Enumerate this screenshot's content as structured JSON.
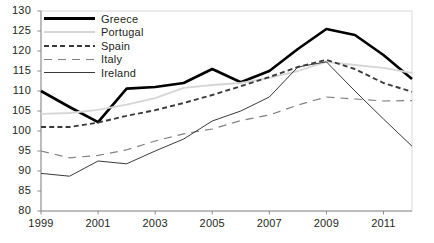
{
  "chart_data": {
    "type": "line",
    "title": "",
    "xlabel": "",
    "ylabel": "",
    "ylim": [
      80,
      130
    ],
    "xlim": [
      1999,
      2012
    ],
    "yticks": [
      80,
      85,
      90,
      95,
      100,
      105,
      110,
      115,
      120,
      125,
      130
    ],
    "xticks": [
      1999,
      2001,
      2003,
      2005,
      2007,
      2009,
      2011
    ],
    "x": [
      1999,
      2000,
      2001,
      2002,
      2003,
      2004,
      2005,
      2006,
      2007,
      2008,
      2009,
      2010,
      2011,
      2012
    ],
    "grid": false,
    "legend_position": "top-left",
    "series": [
      {
        "name": "Greece",
        "style": "solid-thick",
        "color": "#000000",
        "values": [
          110.0,
          106.0,
          102.2,
          110.6,
          111.0,
          112.0,
          115.5,
          112.2,
          115.0,
          120.5,
          125.5,
          124.0,
          119.0,
          113.0
        ]
      },
      {
        "name": "Portugal",
        "style": "solid-light",
        "color": "#d6d6d6",
        "values": [
          104.3,
          104.5,
          105.3,
          106.6,
          108.2,
          110.8,
          111.5,
          112.0,
          113.3,
          115.0,
          117.3,
          116.5,
          115.8,
          114.5
        ]
      },
      {
        "name": "Spain",
        "style": "dashed",
        "color": "#3a3a3a",
        "values": [
          101.0,
          101.0,
          102.1,
          103.8,
          105.2,
          107.0,
          109.0,
          111.2,
          113.5,
          116.0,
          117.8,
          115.5,
          112.0,
          109.8
        ]
      },
      {
        "name": "Italy",
        "style": "long-dash",
        "color": "#808080",
        "values": [
          95.0,
          93.3,
          93.9,
          95.3,
          97.5,
          99.3,
          100.5,
          102.6,
          104.0,
          106.5,
          108.5,
          108.0,
          107.5,
          107.6
        ]
      },
      {
        "name": "Ireland",
        "style": "solid-thin",
        "color": "#3a3a3a",
        "values": [
          89.4,
          88.7,
          92.5,
          91.8,
          95.0,
          98.0,
          102.5,
          105.0,
          108.5,
          116.0,
          117.3,
          110.0,
          103.0,
          96.2
        ]
      }
    ]
  },
  "legend": {
    "items": [
      {
        "label": "Greece"
      },
      {
        "label": "Portugal"
      },
      {
        "label": "Spain"
      },
      {
        "label": "Italy"
      },
      {
        "label": "Ireland"
      }
    ]
  },
  "axes": {
    "y_tick_labels": [
      "130",
      "125",
      "120",
      "115",
      "110",
      "105",
      "100",
      "95",
      "90",
      "85",
      "80"
    ],
    "x_tick_labels": [
      "1999",
      "2001",
      "2003",
      "2005",
      "2007",
      "2009",
      "2011"
    ]
  }
}
